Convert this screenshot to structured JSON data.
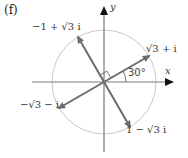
{
  "figure": {
    "part_label": "(f)",
    "axes": {
      "x_label": "x",
      "y_label": "y"
    },
    "angle_label": "30°",
    "unit_circle": true,
    "points": [
      {
        "label": "√3 + i",
        "angle_deg": 30
      },
      {
        "label": "−1 + √3 i",
        "angle_deg": 120
      },
      {
        "label": "−√3 − i",
        "angle_deg": 210
      },
      {
        "label": "1 − √3 i",
        "angle_deg": 300
      }
    ],
    "right_angle_marker_between": [
      "√3 + i",
      "−1 + √3 i"
    ],
    "colors": {
      "arrow": "#6b6b6b",
      "axis": "#7a7a7a",
      "circle": "#c8c8c8",
      "text": "#333333"
    }
  }
}
